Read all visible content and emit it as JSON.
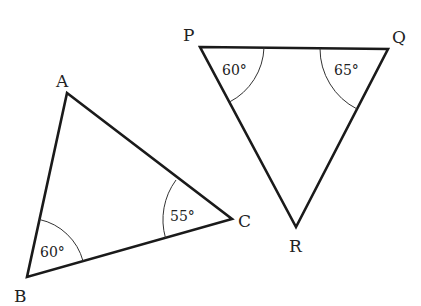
{
  "diagram": {
    "triangles": [
      {
        "name": "ABC",
        "vertices": [
          {
            "label": "A",
            "x": 67,
            "y": 93,
            "lx": 56,
            "ly": 87
          },
          {
            "label": "B",
            "x": 27,
            "y": 277,
            "lx": 14,
            "ly": 302
          },
          {
            "label": "C",
            "x": 232,
            "y": 219,
            "lx": 238,
            "ly": 227
          }
        ],
        "angles": [
          {
            "vertex": "B",
            "value": "60°",
            "tx": 40,
            "ty": 257
          },
          {
            "vertex": "C",
            "value": "55°",
            "tx": 170,
            "ty": 221
          }
        ]
      },
      {
        "name": "PQR",
        "vertices": [
          {
            "label": "P",
            "x": 200,
            "y": 47,
            "lx": 183,
            "ly": 41
          },
          {
            "label": "Q",
            "x": 388,
            "y": 49,
            "lx": 392,
            "ly": 43
          },
          {
            "label": "R",
            "x": 296,
            "y": 227,
            "lx": 289,
            "ly": 252
          }
        ],
        "angles": [
          {
            "vertex": "P",
            "value": "60°",
            "tx": 222,
            "ty": 75
          },
          {
            "vertex": "Q",
            "value": "65°",
            "tx": 334,
            "ty": 75
          }
        ]
      }
    ],
    "labels": {
      "A": "A",
      "B": "B",
      "C": "C",
      "P": "P",
      "Q": "Q",
      "R": "R",
      "angle_B": "60°",
      "angle_C": "55°",
      "angle_P": "60°",
      "angle_Q": "65°"
    },
    "colors": {
      "line": "#1a1a1a",
      "text": "#222222",
      "background": "#ffffff"
    }
  }
}
